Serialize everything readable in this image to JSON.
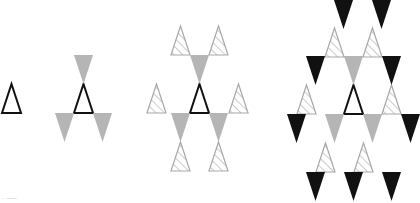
{
  "figure": {
    "colors": {
      "outline": "#111111",
      "gray": "#b5b5b5",
      "black": "#111111",
      "hatch_stroke": "#a8a8a8",
      "background": "#ffffff"
    },
    "triangle_size": {
      "width": 19,
      "height": 29
    },
    "stages": [
      {
        "index": 1,
        "triangles": [
          {
            "type": "outline",
            "dir": "up",
            "x": 2,
            "y": 84
          }
        ]
      },
      {
        "index": 2,
        "triangles": [
          {
            "type": "outline",
            "dir": "up",
            "x": 74,
            "y": 84
          },
          {
            "type": "gray",
            "dir": "down",
            "x": 74,
            "y": 55
          },
          {
            "type": "gray",
            "dir": "down",
            "x": 55,
            "y": 113
          },
          {
            "type": "gray",
            "dir": "down",
            "x": 93,
            "y": 113
          }
        ]
      },
      {
        "index": 3,
        "triangles": [
          {
            "type": "outline",
            "dir": "up",
            "x": 190,
            "y": 84
          },
          {
            "type": "gray",
            "dir": "down",
            "x": 190,
            "y": 55
          },
          {
            "type": "gray",
            "dir": "down",
            "x": 171,
            "y": 113
          },
          {
            "type": "gray",
            "dir": "down",
            "x": 209,
            "y": 113
          },
          {
            "type": "hatched",
            "dir": "up",
            "x": 171,
            "y": 26
          },
          {
            "type": "hatched",
            "dir": "up",
            "x": 209,
            "y": 26
          },
          {
            "type": "hatched",
            "dir": "up",
            "x": 147,
            "y": 84
          },
          {
            "type": "hatched",
            "dir": "up",
            "x": 229,
            "y": 84
          },
          {
            "type": "hatched",
            "dir": "up",
            "x": 171,
            "y": 142
          },
          {
            "type": "hatched",
            "dir": "up",
            "x": 209,
            "y": 142
          }
        ]
      },
      {
        "index": 4,
        "triangles": [
          {
            "type": "outline",
            "dir": "up",
            "x": 344,
            "y": 85
          },
          {
            "type": "gray",
            "dir": "down",
            "x": 344,
            "y": 56
          },
          {
            "type": "gray",
            "dir": "down",
            "x": 325,
            "y": 114
          },
          {
            "type": "gray",
            "dir": "down",
            "x": 363,
            "y": 114
          },
          {
            "type": "hatched",
            "dir": "up",
            "x": 325,
            "y": 28
          },
          {
            "type": "hatched",
            "dir": "up",
            "x": 363,
            "y": 28
          },
          {
            "type": "hatched",
            "dir": "up",
            "x": 297,
            "y": 85
          },
          {
            "type": "hatched",
            "dir": "up",
            "x": 382,
            "y": 85
          },
          {
            "type": "hatched",
            "dir": "up",
            "x": 316,
            "y": 143
          },
          {
            "type": "hatched",
            "dir": "up",
            "x": 354,
            "y": 143
          },
          {
            "type": "black",
            "dir": "down",
            "x": 334,
            "y": 0
          },
          {
            "type": "black",
            "dir": "down",
            "x": 372,
            "y": 0
          },
          {
            "type": "black",
            "dir": "down",
            "x": 306,
            "y": 56
          },
          {
            "type": "black",
            "dir": "down",
            "x": 382,
            "y": 56
          },
          {
            "type": "black",
            "dir": "down",
            "x": 287,
            "y": 114
          },
          {
            "type": "black",
            "dir": "down",
            "x": 401,
            "y": 114
          },
          {
            "type": "black",
            "dir": "down",
            "x": 306,
            "y": 172
          },
          {
            "type": "black",
            "dir": "down",
            "x": 344,
            "y": 172
          },
          {
            "type": "black",
            "dir": "down",
            "x": 382,
            "y": 172
          }
        ]
      }
    ]
  },
  "corner_label": "··  ——"
}
